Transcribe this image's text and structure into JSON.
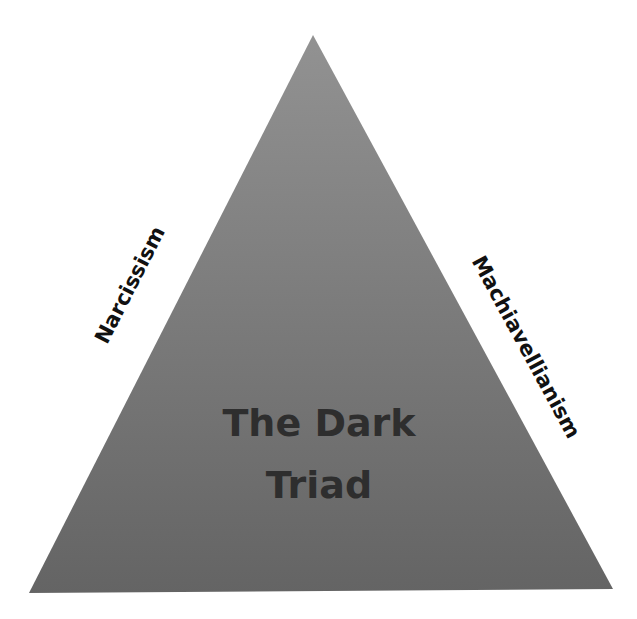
{
  "diagram": {
    "type": "triangle",
    "title_lines": [
      "The Dark",
      "Triad"
    ],
    "side_labels": {
      "left": "Narcissism",
      "right": "Machiavellianism"
    },
    "colors": {
      "fill_top": "#8e8e8e",
      "fill_bottom": "#666666",
      "text": "#2e2e2e",
      "label_text": "#111111",
      "background": "#ffffff"
    }
  }
}
